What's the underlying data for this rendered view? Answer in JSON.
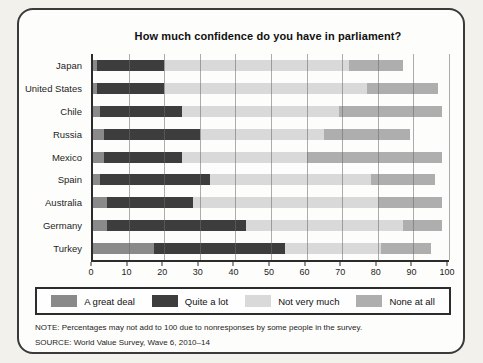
{
  "panel": {
    "note": "NOTE: Percentages may not add to 100 due to nonresponses by some people in the survey.",
    "source": "SOURCE: World Value Survey, Wave 6, 2010–14"
  },
  "chart_data": {
    "type": "bar",
    "orientation": "horizontal",
    "stacked": true,
    "title": "How much confidence do you have in parliament?",
    "categories": [
      "Japan",
      "United States",
      "Chile",
      "Russia",
      "Mexico",
      "Spain",
      "Australia",
      "Germany",
      "Turkey"
    ],
    "series": [
      {
        "name": "A great deal",
        "color": "#8a8a8a",
        "values": [
          1,
          1,
          2,
          3,
          3,
          2,
          4,
          4,
          17
        ]
      },
      {
        "name": "Quite a lot",
        "color": "#3d3d3d",
        "values": [
          19,
          19,
          23,
          27,
          22,
          31,
          24,
          39,
          37
        ]
      },
      {
        "name": "Not very much",
        "color": "#d9d9d9",
        "values": [
          52,
          57,
          44,
          35,
          35,
          45,
          52,
          44,
          27
        ]
      },
      {
        "name": "None at all",
        "color": "#aeaeae",
        "values": [
          15,
          20,
          29,
          24,
          38,
          18,
          18,
          11,
          14
        ]
      }
    ],
    "xlim": [
      0,
      100
    ],
    "xticks": [
      0,
      10,
      20,
      30,
      40,
      50,
      60,
      70,
      80,
      90,
      100
    ],
    "grid": true,
    "legend_position": "bottom",
    "axis_color": "#2c2c2c",
    "gridline_color": "#696969"
  }
}
